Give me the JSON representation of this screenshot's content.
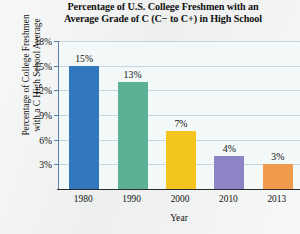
{
  "chart_data": {
    "type": "bar",
    "title": "Percentage of U.S. College Freshmen with an Average Grade of C (C− to C+) in High School",
    "title_lines": [
      "Percentage of U.S. College Freshmen with an",
      "Average Grade of C (C− to C+) in High School"
    ],
    "xlabel": "Year",
    "ylabel": "Percentage of College Freshmen with a C High School Average",
    "ylabel_lines": [
      "Percentage of College Freshmen",
      "with a C High School Average"
    ],
    "categories": [
      "1980",
      "1990",
      "2000",
      "2010",
      "2013"
    ],
    "values": [
      15,
      13,
      7,
      4,
      3
    ],
    "value_labels": [
      "15%",
      "13%",
      "7%",
      "4%",
      "3%"
    ],
    "bar_colors": [
      "#3277bd",
      "#5cb096",
      "#f4c51e",
      "#8d84c6",
      "#f09a4e"
    ],
    "ylim": [
      0,
      18
    ],
    "yticks": [
      3,
      6,
      9,
      12,
      15,
      18
    ],
    "ytick_labels": [
      "3%",
      "6%",
      "9%",
      "12%",
      "15%",
      "18%"
    ],
    "grid": true,
    "legend": "none",
    "plot_background": "#f3f8f9",
    "gridline_color": "#c3d6e4",
    "axis_color": "#2c2c2c"
  }
}
